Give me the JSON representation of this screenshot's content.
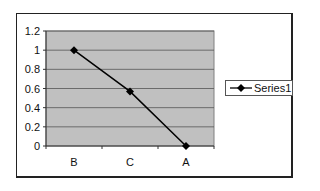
{
  "chart_data": {
    "type": "line",
    "title": "",
    "xlabel": "",
    "ylabel": "",
    "categories": [
      "B",
      "C",
      "A"
    ],
    "series": [
      {
        "name": "Series1",
        "values": [
          1.0,
          0.57,
          0.0
        ],
        "color": "#000000",
        "marker": "diamond"
      }
    ],
    "ylim": [
      0,
      1.2
    ],
    "yticks": [
      "0",
      "0.2",
      "0.4",
      "0.6",
      "0.8",
      "1",
      "1.2"
    ],
    "grid": true,
    "plot_background": "#c0c0c0",
    "legend_position": "right"
  },
  "legend": {
    "label": "Series1"
  }
}
